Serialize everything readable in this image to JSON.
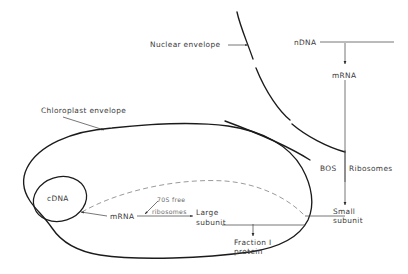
{
  "figure": {
    "background_color": "#ffffff",
    "line_color": "#1b1b1b",
    "text_color": "#3a3a3a",
    "faint_text_color": "#6b6b6b"
  },
  "labels": {
    "nuclear_envelope": "Nuclear envelope",
    "chloroplast_envelope": "Chloroplast envelope",
    "ndna": "nDNA",
    "mrna_nuclear": "mRNA",
    "ribosomes_80s": "BOS Ribosomes",
    "ribosomes_80s_size": "BOS",
    "ribosomes_80s_word": "Ribosomes",
    "small_subunit_line1": "Small",
    "small_subunit_line2": "subunit",
    "cdna": "cDNA",
    "mrna_chloroplast": "mRNA",
    "free_ribosomes_line1": "70S free",
    "free_ribosomes_line2": "ribosomes",
    "large_subunit_line1": "Large",
    "large_subunit_line2": "subunit",
    "fraction_i_line1": "Fraction I",
    "fraction_i_line2": "protein"
  }
}
